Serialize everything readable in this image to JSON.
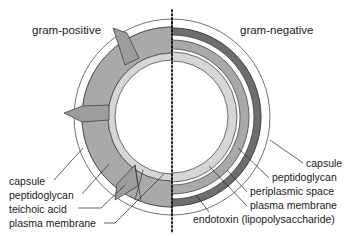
{
  "diagram": {
    "left_panel": {
      "title": "gram-positive",
      "labels": [
        "capsule",
        "peptidoglycan",
        "teichoic acid",
        "plasma membrane"
      ]
    },
    "right_panel": {
      "title": "gram-negative",
      "labels": [
        "capsule",
        "peptidoglycan",
        "periplasmic space",
        "plasma membrane",
        "endotoxin (lipopolysaccharide)"
      ]
    },
    "colors": {
      "capsule": "#ffffff",
      "gp_peptidoglycan": "#a9a9a9",
      "gp_membrane": "#d6d6d6",
      "gn_endotoxin": "#6e6e6e",
      "gn_peptidoglycan": "#a9a9a9",
      "gn_membrane": "#d6d6d6",
      "teichoic_acid": "#9c9c9c",
      "divider": "#111111"
    }
  }
}
